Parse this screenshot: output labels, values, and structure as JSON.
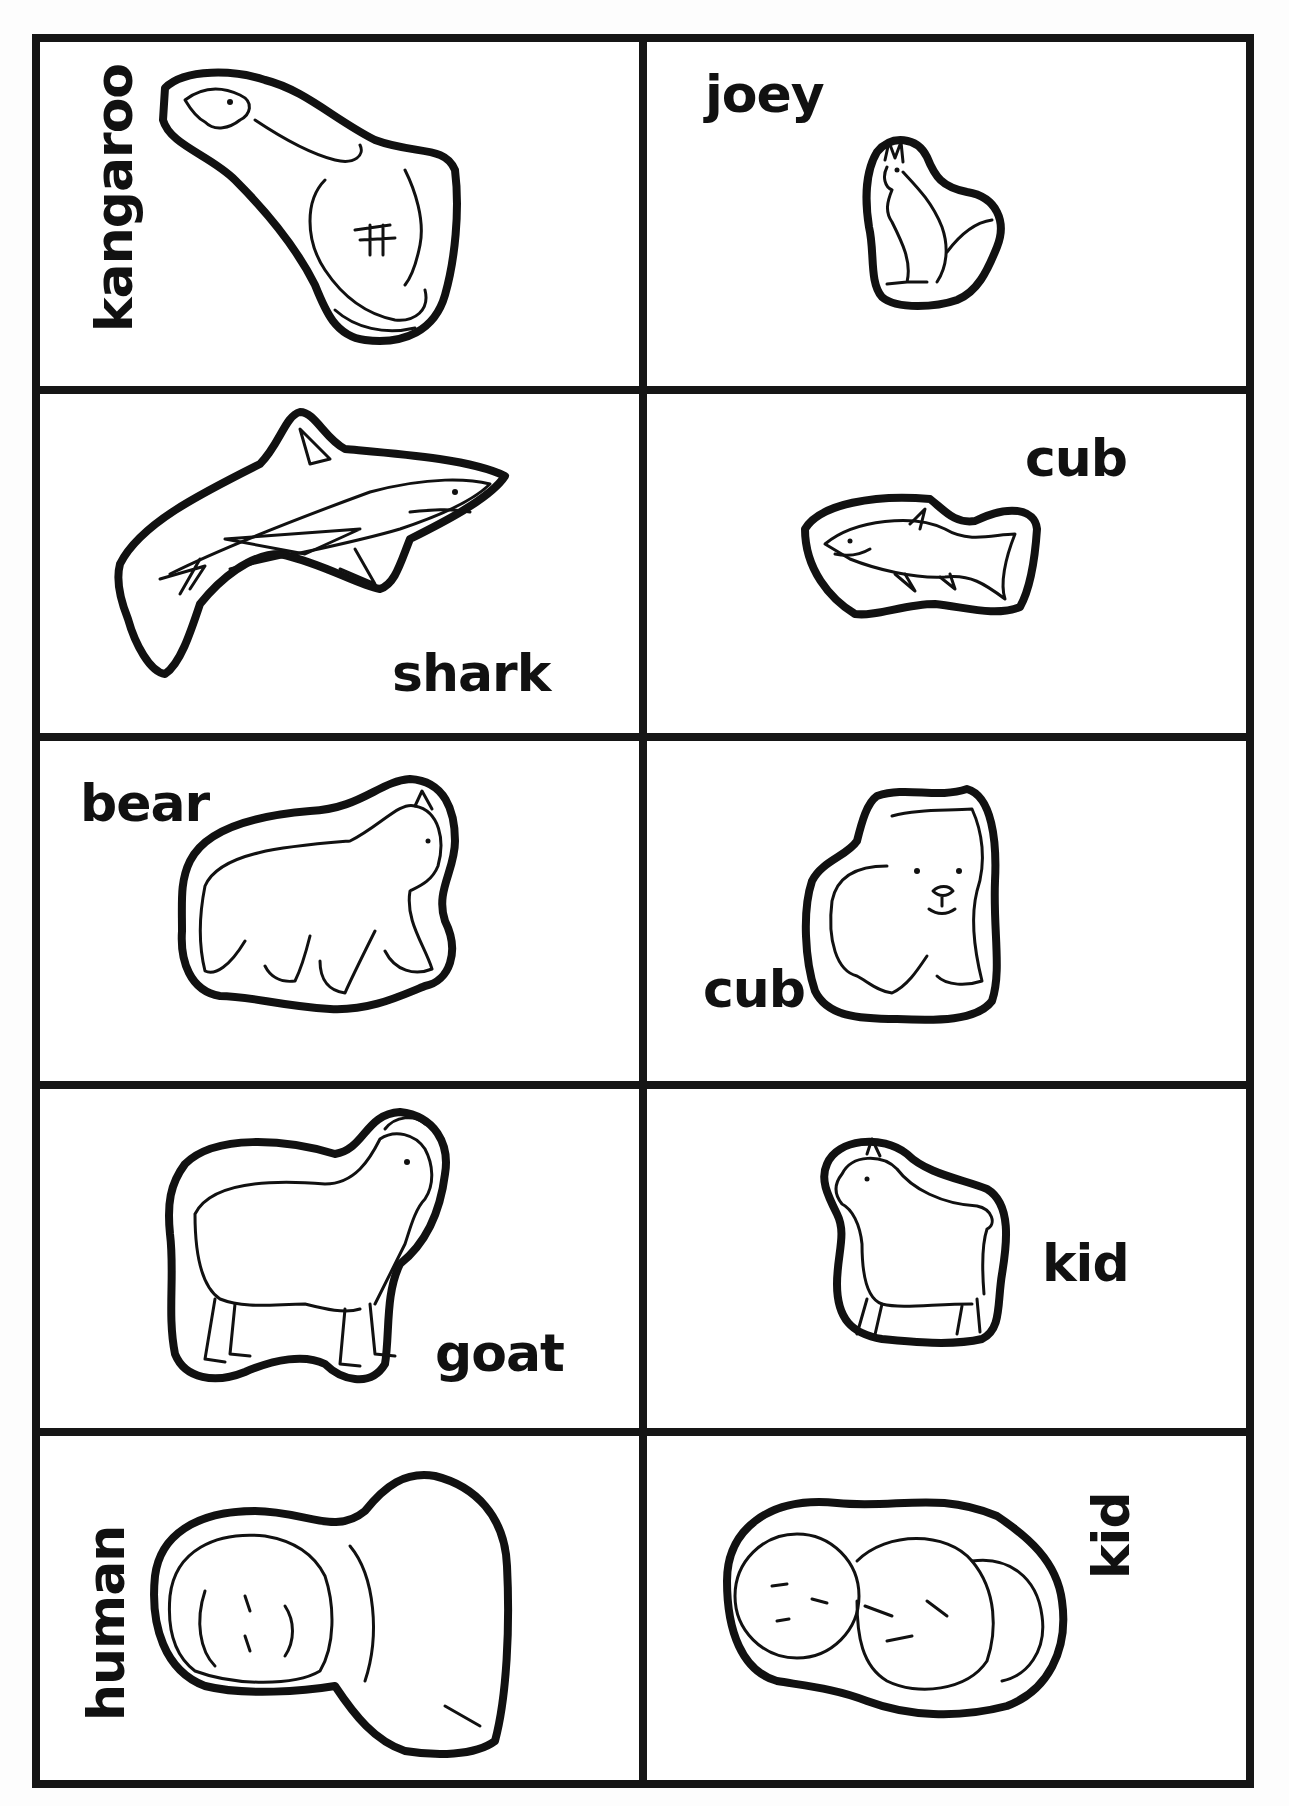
{
  "worksheet": {
    "layout": {
      "columns": 2,
      "rows": 5
    },
    "cards": [
      {
        "row": 1,
        "column": 1,
        "animal": "kangaroo",
        "label": "kangaroo",
        "label_orientation": "vertical",
        "kind": "adult"
      },
      {
        "row": 1,
        "column": 2,
        "animal": "kangaroo",
        "label": "joey",
        "label_orientation": "horizontal",
        "kind": "baby"
      },
      {
        "row": 2,
        "column": 1,
        "animal": "shark",
        "label": "shark",
        "label_orientation": "horizontal",
        "kind": "adult"
      },
      {
        "row": 2,
        "column": 2,
        "animal": "shark",
        "label": "cub",
        "label_orientation": "horizontal",
        "kind": "baby"
      },
      {
        "row": 3,
        "column": 1,
        "animal": "bear",
        "label": "bear",
        "label_orientation": "horizontal",
        "kind": "adult"
      },
      {
        "row": 3,
        "column": 2,
        "animal": "bear",
        "label": "cub",
        "label_orientation": "horizontal",
        "kind": "baby"
      },
      {
        "row": 4,
        "column": 1,
        "animal": "goat",
        "label": "goat",
        "label_orientation": "horizontal",
        "kind": "adult"
      },
      {
        "row": 4,
        "column": 2,
        "animal": "goat",
        "label": "kid",
        "label_orientation": "horizontal",
        "kind": "baby"
      },
      {
        "row": 5,
        "column": 1,
        "animal": "human",
        "label": "human",
        "label_orientation": "vertical",
        "kind": "adult"
      },
      {
        "row": 5,
        "column": 2,
        "animal": "human",
        "label": "kid",
        "label_orientation": "vertical",
        "kind": "baby"
      }
    ],
    "colors": {
      "ink": "#111111",
      "border": "#161616",
      "paper": "#ffffff"
    }
  }
}
